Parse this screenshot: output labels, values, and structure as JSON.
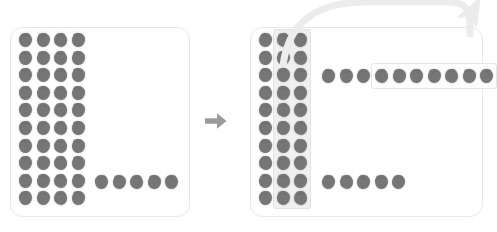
{
  "caption": {
    "clipped_text_left": "—— — — —— —— ——  —",
    "clipped_text_right": "— — —   —  — ——   —  ——"
  },
  "colors": {
    "dot": "#767676",
    "panel_border": "#e8e8ea",
    "panel_fill": "#ffffff",
    "highlight_band": "#f0f0f1",
    "group_box_border": "#e6e6e8",
    "mid_arrow": "#9a9a9a",
    "sweep_arrow": "#ececec",
    "caption_text": "#c9c9cd"
  },
  "left_panel": {
    "name": "before-state-panel",
    "grid": {
      "rows": 10,
      "cols": 4,
      "total_dots": 40
    },
    "loose_row": {
      "row_index": 9,
      "count": 5
    }
  },
  "right_panel": {
    "name": "after-state-panel",
    "grid": {
      "rows": 10,
      "cols": 3,
      "total_dots": 30
    },
    "highlight_band": {
      "covers_columns": [
        2,
        3
      ],
      "label": "selected-columns"
    },
    "top_row": {
      "row_index": 3,
      "ungrouped_count": 3,
      "grouped_count": 7,
      "grouped_label": "boxed-group"
    },
    "bottom_row": {
      "row_index": 9,
      "count": 5
    }
  },
  "arrows": {
    "middle": {
      "name": "transition-arrow",
      "direction": "right"
    },
    "sweep": {
      "name": "sweep-curved-arrow",
      "direction": "up-right"
    }
  }
}
